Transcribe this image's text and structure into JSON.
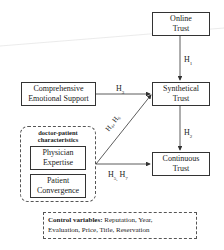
{
  "nodes": {
    "online_trust": [
      "Online",
      "Trust"
    ],
    "synthetical_trust": [
      "Synthetical",
      "Trust"
    ],
    "continuous_trust": [
      "Continuous",
      "Trust"
    ],
    "comprehensive_support": [
      "Comprehensive",
      "Emotional Support"
    ],
    "physician_expertise": [
      "Physician",
      "Expertise"
    ],
    "patient_convergence": [
      "Patient",
      "Convergence"
    ]
  },
  "group": {
    "title": [
      "doctor-patient",
      "characteristics"
    ]
  },
  "edges": {
    "h1": {
      "base": "H",
      "sub": "1"
    },
    "h2": {
      "base": "H",
      "sub": "2"
    },
    "h3": {
      "base": "H",
      "sub": "3"
    },
    "h4h6": "H₄, H₆",
    "h5h7": {
      "a": "H",
      "a_sub": "5,",
      "b": "H",
      "b_sub": "7"
    }
  },
  "control": {
    "label": "Control variables:",
    "line1": " Reputation, Year,",
    "line2": "Evaluation, Price, Title, Reservation"
  }
}
